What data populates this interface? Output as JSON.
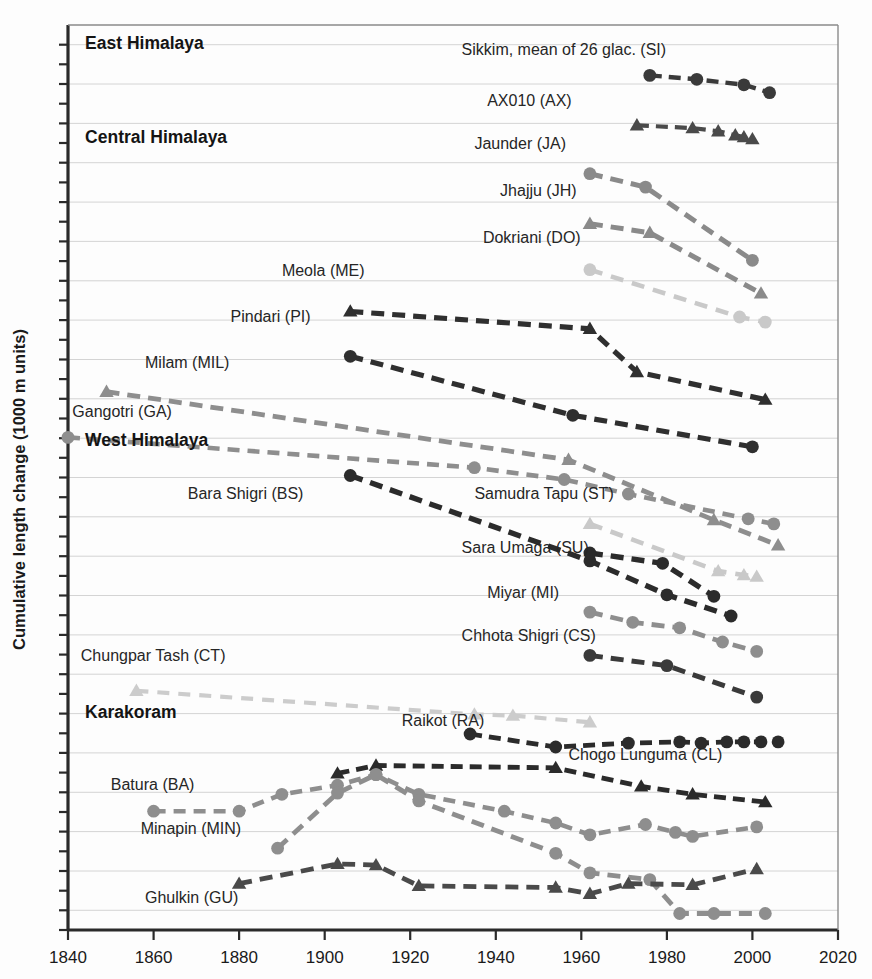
{
  "axes": {
    "ylabel": "Cumulative length change (1000 m units)",
    "xlabel": "",
    "xticks": [
      "1840",
      "1860",
      "1880",
      "1900",
      "1920",
      "1940",
      "1960",
      "1980",
      "2000",
      "2020"
    ],
    "xlim": [
      1840,
      2020
    ],
    "ylim": [
      -22.5,
      0.5
    ],
    "grid": true
  },
  "regions": [
    {
      "name": "East Himalaya",
      "label": "East Himalaya",
      "x": 1844,
      "y": -0.1
    },
    {
      "name": "Central Himalaya",
      "label": "Central Himalaya",
      "x": 1844,
      "y": -2.5
    },
    {
      "name": "West Himalaya",
      "label": "West Himalaya",
      "x": 1844,
      "y": -10.2
    },
    {
      "name": "Karakoram",
      "label": "Karakoram",
      "x": 1844,
      "y": -17.1
    }
  ],
  "chart_data": {
    "type": "line",
    "title": "",
    "xlabel": "",
    "ylabel": "Cumulative length change (1000 m units)",
    "xlim": [
      1840,
      2020
    ],
    "ylim": [
      -22.5,
      0.5
    ],
    "grid": true,
    "legend_position": "inline-labels",
    "marker_shapes": [
      "circle",
      "triangle"
    ],
    "series": [
      {
        "name": "Sikkim, mean of 26 glac. (SI)",
        "code": "SI",
        "label": "Sikkim, mean of 26 glac. (SI)",
        "label_x": 1932,
        "label_y": -0.25,
        "marker": "circle",
        "color": "#3a3a3a",
        "dash": "12,7",
        "width": 4.4,
        "points": [
          [
            1976,
            -0.78
          ],
          [
            1987,
            -0.88
          ],
          [
            1998,
            -1.02
          ],
          [
            2004,
            -1.22
          ]
        ]
      },
      {
        "name": "AX010 (AX)",
        "code": "AX",
        "label": "AX010 (AX)",
        "label_x": 1938,
        "label_y": -1.55,
        "marker": "triangle",
        "color": "#4a4a4a",
        "dash": "12,7",
        "width": 4.2,
        "points": [
          [
            1973,
            -2.05
          ],
          [
            1986,
            -2.12
          ],
          [
            1992,
            -2.2
          ],
          [
            1996,
            -2.3
          ],
          [
            1998,
            -2.35
          ],
          [
            2000,
            -2.4
          ]
        ]
      },
      {
        "name": "Jaunder (JA)",
        "code": "JA",
        "label": "Jaunder (JA)",
        "label_x": 1935,
        "label_y": -2.65,
        "marker": "circle",
        "color": "#8a8a8a",
        "dash": "13,8",
        "width": 5.0,
        "points": [
          [
            1962,
            -3.28
          ],
          [
            1975,
            -3.62
          ],
          [
            2000,
            -5.48
          ]
        ]
      },
      {
        "name": "Jhajju (JH)",
        "code": "JH",
        "label": "Jhajju (JH)",
        "label_x": 1941,
        "label_y": -3.85,
        "marker": "triangle",
        "color": "#8a8a8a",
        "dash": "13,8",
        "width": 5.0,
        "points": [
          [
            1962,
            -4.55
          ],
          [
            1976,
            -4.78
          ],
          [
            2002,
            -6.32
          ]
        ]
      },
      {
        "name": "Dokriani (DO)",
        "code": "DO",
        "label": "Dokriani (DO)",
        "label_x": 1937,
        "label_y": -5.05,
        "marker": "circle",
        "color": "#c9c9c9",
        "dash": "13,9",
        "width": 4.6,
        "points": [
          [
            1962,
            -5.72
          ],
          [
            1997,
            -6.92
          ],
          [
            2003,
            -7.05
          ]
        ]
      },
      {
        "name": "Meola (ME)",
        "code": "ME",
        "label": "Meola (ME)",
        "label_x": 1890,
        "label_y": -5.88,
        "marker": "triangle",
        "color": "#2f2f2f",
        "dash": "13,8",
        "width": 5.2,
        "points": [
          [
            1906,
            -6.78
          ],
          [
            1962,
            -7.22
          ],
          [
            1973,
            -8.32
          ],
          [
            2003,
            -9.02
          ]
        ]
      },
      {
        "name": "Pindari (PI)",
        "code": "PI",
        "label": "Pindari (PI)",
        "label_x": 1878,
        "label_y": -7.05,
        "marker": "circle",
        "color": "#2f2f2f",
        "dash": "13,8",
        "width": 5.2,
        "points": [
          [
            1906,
            -7.92
          ],
          [
            1958,
            -9.42
          ],
          [
            2000,
            -10.22
          ]
        ]
      },
      {
        "name": "Milam (MIL)",
        "code": "MIL",
        "label": "Milam (MIL)",
        "label_x": 1858,
        "label_y": -8.22,
        "marker": "triangle",
        "color": "#8e8e8e",
        "dash": "13,8",
        "width": 4.8,
        "points": [
          [
            1849,
            -8.82
          ],
          [
            1957,
            -10.55
          ],
          [
            1991,
            -12.08
          ],
          [
            2006,
            -12.72
          ]
        ]
      },
      {
        "name": "Gangotri (GA)",
        "code": "GA",
        "label": "Gangotri (GA)",
        "label_x": 1841,
        "label_y": -9.45,
        "marker": "circle",
        "color": "#8e8e8e",
        "dash": "12,8",
        "width": 4.6,
        "points": [
          [
            1840,
            -9.98
          ],
          [
            1935,
            -10.75
          ],
          [
            1956,
            -11.05
          ],
          [
            1971,
            -11.42
          ],
          [
            1999,
            -12.05
          ],
          [
            2005,
            -12.18
          ]
        ]
      },
      {
        "name": "Bara Shigri (BS)",
        "code": "BS",
        "label": "Bara Shigri (BS)",
        "label_x": 1868,
        "label_y": -11.55,
        "marker": "circle",
        "color": "#2b2b2b",
        "dash": "13,8",
        "width": 5.4,
        "points": [
          [
            1906,
            -10.95
          ],
          [
            1962,
            -13.12
          ],
          [
            1980,
            -13.98
          ],
          [
            1995,
            -14.52
          ]
        ]
      },
      {
        "name": "Samudra Tapu (ST)",
        "code": "ST",
        "label": "Samudra Tapu (ST)",
        "label_x": 1935,
        "label_y": -11.55,
        "marker": "triangle",
        "color": "#c9c9c9",
        "dash": "13,9",
        "width": 4.6,
        "points": [
          [
            1962,
            -12.18
          ],
          [
            1992,
            -13.38
          ],
          [
            1998,
            -13.48
          ],
          [
            2001,
            -13.52
          ]
        ]
      },
      {
        "name": "Sara Umaga (SU)",
        "code": "SU",
        "label": "Sara Umaga (SU)",
        "label_x": 1932,
        "label_y": -12.92,
        "marker": "circle",
        "color": "#2b2b2b",
        "dash": "13,8",
        "width": 5.4,
        "points": [
          [
            1962,
            -12.92
          ],
          [
            1979,
            -13.18
          ],
          [
            1991,
            -14.02
          ]
        ]
      },
      {
        "name": "Miyar (MI)",
        "code": "MI",
        "label": "Miyar (MI)",
        "label_x": 1938,
        "label_y": -14.05,
        "marker": "circle",
        "color": "#8e8e8e",
        "dash": "13,8",
        "width": 4.8,
        "points": [
          [
            1962,
            -14.42
          ],
          [
            1972,
            -14.68
          ],
          [
            1983,
            -14.82
          ],
          [
            1993,
            -15.18
          ],
          [
            2001,
            -15.42
          ]
        ]
      },
      {
        "name": "Chhota Shigri (CS)",
        "code": "CS",
        "label": "Chhota Shigri (CS)",
        "label_x": 1932,
        "label_y": -15.15,
        "marker": "circle",
        "color": "#3a3a3a",
        "dash": "13,8",
        "width": 5.0,
        "points": [
          [
            1962,
            -15.52
          ],
          [
            1980,
            -15.78
          ],
          [
            2001,
            -16.58
          ]
        ]
      },
      {
        "name": "Chungpar Tash (CT)",
        "code": "CT",
        "label": "Chungpar Tash (CT)",
        "label_x": 1843,
        "label_y": -15.65,
        "marker": "triangle",
        "color": "#cccccc",
        "dash": "12,9",
        "width": 4.2,
        "points": [
          [
            1856,
            -16.42
          ],
          [
            1935,
            -17.02
          ],
          [
            1944,
            -17.05
          ],
          [
            1962,
            -17.22
          ]
        ]
      },
      {
        "name": "Raikot (RA)",
        "code": "RA",
        "label": "Raikot (RA)",
        "label_x": 1918,
        "label_y": -17.32,
        "marker": "circle",
        "color": "#2b2b2b",
        "dash": "12,7",
        "width": 4.8,
        "points": [
          [
            1934,
            -17.52
          ],
          [
            1954,
            -17.85
          ],
          [
            1971,
            -17.75
          ],
          [
            1983,
            -17.72
          ],
          [
            1988,
            -17.75
          ],
          [
            1994,
            -17.72
          ],
          [
            1998,
            -17.72
          ],
          [
            2002,
            -17.72
          ],
          [
            2006,
            -17.72
          ]
        ]
      },
      {
        "name": "Chogo Lunguma (CL)",
        "code": "CL",
        "label": "Chogo Lunguma (CL)",
        "label_x": 1957,
        "label_y": -18.18,
        "marker": "triangle",
        "color": "#2b2b2b",
        "dash": "12,7",
        "width": 4.8,
        "points": [
          [
            1903,
            -18.52
          ],
          [
            1912,
            -18.32
          ],
          [
            1954,
            -18.38
          ],
          [
            1974,
            -18.85
          ],
          [
            1986,
            -19.05
          ],
          [
            2003,
            -19.25
          ]
        ]
      },
      {
        "name": "Batura (BA)",
        "code": "BA",
        "label": "Batura (BA)",
        "label_x": 1850,
        "label_y": -18.95,
        "marker": "circle",
        "color": "#8e8e8e",
        "dash": "12,8",
        "width": 4.6,
        "points": [
          [
            1860,
            -19.48
          ],
          [
            1880,
            -19.48
          ],
          [
            1890,
            -19.05
          ],
          [
            1903,
            -18.82
          ],
          [
            1912,
            -18.55
          ],
          [
            1922,
            -19.05
          ],
          [
            1942,
            -19.48
          ],
          [
            1954,
            -19.78
          ],
          [
            1962,
            -20.08
          ],
          [
            1975,
            -19.82
          ],
          [
            1982,
            -20.02
          ],
          [
            1986,
            -20.12
          ],
          [
            2001,
            -19.88
          ]
        ]
      },
      {
        "name": "Minapin (MIN)",
        "code": "MIN",
        "label": "Minapin (MIN)",
        "label_x": 1857,
        "label_y": -20.05,
        "marker": "circle",
        "color": "#8e8e8e",
        "dash": "13,8",
        "width": 4.8,
        "points": [
          [
            1889,
            -20.42
          ],
          [
            1903,
            -19.02
          ],
          [
            1912,
            -18.55
          ],
          [
            1922,
            -19.22
          ],
          [
            1954,
            -20.55
          ],
          [
            1962,
            -21.05
          ],
          [
            1976,
            -21.22
          ],
          [
            1983,
            -22.08
          ],
          [
            1991,
            -22.08
          ],
          [
            2003,
            -22.08
          ]
        ]
      },
      {
        "name": "Ghulkin (GU)",
        "code": "GU",
        "label": "Ghulkin (GU)",
        "label_x": 1858,
        "label_y": -21.82,
        "marker": "triangle",
        "color": "#4a4a4a",
        "dash": "13,8",
        "width": 4.8,
        "points": [
          [
            1880,
            -21.32
          ],
          [
            1903,
            -20.82
          ],
          [
            1912,
            -20.85
          ],
          [
            1922,
            -21.38
          ],
          [
            1954,
            -21.42
          ],
          [
            1962,
            -21.58
          ],
          [
            1971,
            -21.32
          ],
          [
            1986,
            -21.35
          ],
          [
            2001,
            -20.95
          ]
        ]
      }
    ]
  }
}
